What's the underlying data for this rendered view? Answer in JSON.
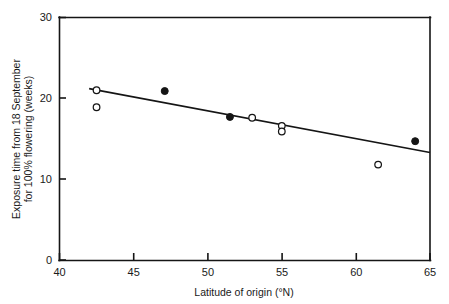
{
  "chart_data": {
    "type": "scatter",
    "title": "",
    "xlabel": "Latitude of origin (°N)",
    "ylabel": "Exposure time from 18 September for 100% flowering (weeks)",
    "ylabel_line1": "Exposure time from 18 September",
    "ylabel_line2": "for 100% flowering (weeks)",
    "xlim": [
      40,
      65
    ],
    "ylim": [
      0,
      30
    ],
    "xticks": [
      40,
      45,
      50,
      55,
      60,
      65
    ],
    "yticks": [
      0,
      10,
      20,
      30
    ],
    "xtick_labels": [
      "40",
      "45",
      "50",
      "55",
      "60",
      "65"
    ],
    "ytick_labels": [
      "0",
      "10",
      "20",
      "30"
    ],
    "grid": false,
    "legend": "none",
    "series": [
      {
        "name": "open-circles",
        "marker": "open-circle",
        "points": [
          {
            "x": 42.5,
            "y": 21.0
          },
          {
            "x": 42.5,
            "y": 18.9
          },
          {
            "x": 53.0,
            "y": 17.6
          },
          {
            "x": 55.0,
            "y": 16.6
          },
          {
            "x": 55.0,
            "y": 15.9
          },
          {
            "x": 61.5,
            "y": 11.8
          }
        ]
      },
      {
        "name": "filled-circles",
        "marker": "filled-circle",
        "points": [
          {
            "x": 47.1,
            "y": 20.9
          },
          {
            "x": 51.5,
            "y": 17.7
          },
          {
            "x": 64.0,
            "y": 14.7
          }
        ]
      }
    ],
    "trend_line": {
      "name": "regression-line",
      "x_start": 42.0,
      "y_start": 21.2,
      "x_end": 65.0,
      "y_end": 13.3
    }
  },
  "axes": {
    "x_tick_0": "40",
    "x_tick_1": "45",
    "x_tick_2": "50",
    "x_tick_3": "55",
    "x_tick_4": "60",
    "x_tick_5": "65",
    "y_tick_0": "0",
    "y_tick_1": "10",
    "y_tick_2": "20",
    "y_tick_3": "30"
  }
}
